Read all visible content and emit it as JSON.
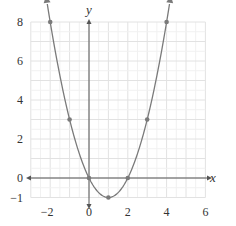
{
  "chart_data": {
    "type": "line",
    "title": "",
    "xlabel": "x",
    "ylabel": "y",
    "function": "y = x^2 - 2x",
    "xlim": [
      -3,
      6
    ],
    "ylim": [
      -1,
      8
    ],
    "grid": true,
    "x_ticks": [
      -2,
      0,
      2,
      4,
      6
    ],
    "y_ticks": [
      -1,
      0,
      2,
      4,
      6,
      8
    ],
    "x_tick_labels": [
      "−2",
      "0",
      "2",
      "4",
      "6"
    ],
    "y_tick_labels": [
      "−1",
      "0",
      "2",
      "4",
      "6",
      "8"
    ],
    "series": [
      {
        "name": "parabola",
        "points": [
          {
            "x": -2,
            "y": 8
          },
          {
            "x": -1,
            "y": 3
          },
          {
            "x": 0,
            "y": 0
          },
          {
            "x": 1,
            "y": -1
          },
          {
            "x": 2,
            "y": 0
          },
          {
            "x": 3,
            "y": 3
          },
          {
            "x": 4,
            "y": 8
          }
        ],
        "arrows_at_ends": true
      }
    ]
  },
  "style": {
    "curve_color": "#7a7a7a",
    "point_color": "#7a7a7a",
    "axis_color": "#555555",
    "grid_color": "#e6e6e6"
  },
  "labels": {
    "x_axis": "x",
    "y_axis": "y"
  }
}
